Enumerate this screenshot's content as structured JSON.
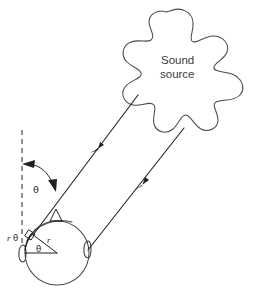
{
  "figure": {
    "background_color": "#ffffff",
    "ink_color": "#231f20",
    "outline_color": "#4a4a4a",
    "width": 257,
    "height": 303
  },
  "labels": {
    "source_line1": "Sound",
    "source_line2": "source",
    "angle_theta_incident": "θ",
    "angle_theta_center": "θ",
    "arc_length": "rθ",
    "arc_length_r": "r",
    "arc_length_theta": "θ",
    "radius_r": "r",
    "delta_symbol": "△"
  },
  "elements": {
    "sound_source_blob": "irregular-star-blob",
    "head": "circle",
    "left_ear": "ear-marker",
    "right_ear": "ear-marker",
    "reference_line": "dashed-vertical",
    "ray_left": "incident-ray-to-left-ear",
    "ray_right": "incident-ray-to-right-ear",
    "right_angle_marker": "perpendicular-square",
    "angle_arc": "theta-double-arrow"
  },
  "geometry": {
    "head_center_x": 57,
    "head_center_y": 253,
    "head_radius": 32,
    "dashed_line_x": 22,
    "dashed_line_top_y": 130,
    "dashed_line_bottom_y": 247,
    "ray_left_start_x": 138,
    "ray_left_start_y": 95,
    "ray_right_start_x": 184,
    "ray_right_start_y": 128,
    "arrow_left_x": 96,
    "arrow_left_y": 148,
    "arrow_right_x": 141,
    "arrow_right_y": 183
  }
}
